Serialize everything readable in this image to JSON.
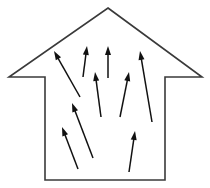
{
  "canvas": {
    "width": 210,
    "height": 188,
    "background_color": "#ffffff",
    "title": "House cross-section with upward airflow arrows"
  },
  "style": {
    "outline_color": "#3a3a3a",
    "outline_width": 1.6,
    "arrow_color": "#111111",
    "arrow_width": 1.5,
    "arrow_head_length": 9,
    "arrow_head_width": 6
  },
  "house": {
    "label": "house-outline",
    "description": "Closed polygon: roof gable with eaves and rectangular body",
    "points": "108,8 202,77 165,77 165,180 45,180 45,77 9,77",
    "apex": {
      "x": 108,
      "y": 8
    },
    "left_eave": {
      "x": 9,
      "y": 77
    },
    "right_eave": {
      "x": 202,
      "y": 77
    },
    "wall_left_x": 45,
    "wall_right_x": 165,
    "floor_y": 180,
    "eave_y": 77
  },
  "arrows": [
    {
      "name": "arrow-upper-left-long",
      "x1": 80,
      "y1": 97,
      "x2": 54,
      "y2": 51
    },
    {
      "name": "arrow-top-center-left",
      "x1": 83,
      "y1": 77,
      "x2": 87,
      "y2": 46
    },
    {
      "name": "arrow-top-center-right",
      "x1": 108,
      "y1": 78,
      "x2": 108,
      "y2": 46
    },
    {
      "name": "arrow-mid-center",
      "x1": 101,
      "y1": 117,
      "x2": 95,
      "y2": 72
    },
    {
      "name": "arrow-mid-right",
      "x1": 120,
      "y1": 117,
      "x2": 129,
      "y2": 72
    },
    {
      "name": "arrow-upper-right-long",
      "x1": 152,
      "y1": 122,
      "x2": 140,
      "y2": 51
    },
    {
      "name": "arrow-lower-left-inner",
      "x1": 93,
      "y1": 158,
      "x2": 72,
      "y2": 103
    },
    {
      "name": "arrow-lower-left-outer",
      "x1": 78,
      "y1": 169,
      "x2": 62,
      "y2": 127
    },
    {
      "name": "arrow-lower-right",
      "x1": 129,
      "y1": 172,
      "x2": 135,
      "y2": 131
    }
  ]
}
